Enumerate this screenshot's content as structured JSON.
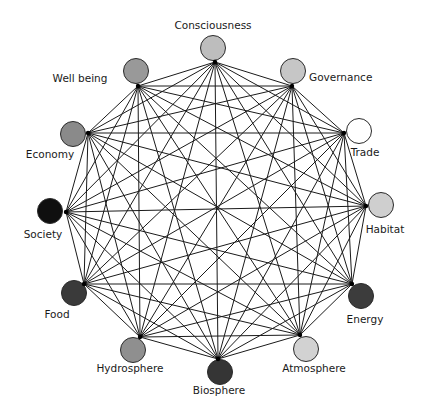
{
  "diagram": {
    "type": "complete-graph",
    "edge_color": "#1a1a1a",
    "nodes": [
      {
        "label": "Consciousness",
        "fill": "#bdbdbd",
        "cx": 213,
        "cy": 48,
        "ax": 215,
        "ay": 62,
        "lx": 213,
        "ly": 25,
        "anchor": "center"
      },
      {
        "label": "Governance",
        "fill": "#c6c6c6",
        "cx": 293,
        "cy": 71,
        "ax": 292,
        "ay": 86,
        "lx": 309,
        "ly": 77,
        "anchor": "left"
      },
      {
        "label": "Trade",
        "fill": "#ffffff",
        "cx": 359,
        "cy": 131,
        "ax": 344,
        "ay": 133,
        "lx": 365,
        "ly": 152,
        "anchor": "center"
      },
      {
        "label": "Habitat",
        "fill": "#cfcfcf",
        "cx": 381,
        "cy": 205,
        "ax": 366,
        "ay": 206,
        "lx": 385,
        "ly": 229,
        "anchor": "center"
      },
      {
        "label": "Energy",
        "fill": "#3c3c3c",
        "cx": 361,
        "cy": 296,
        "ax": 352,
        "ay": 284,
        "lx": 365,
        "ly": 319,
        "anchor": "center"
      },
      {
        "label": "Atmosphere",
        "fill": "#d2d2d2",
        "cx": 306,
        "cy": 349,
        "ax": 300,
        "ay": 335,
        "lx": 314,
        "ly": 368,
        "anchor": "center"
      },
      {
        "label": "Biosphere",
        "fill": "#353535",
        "cx": 220,
        "cy": 372,
        "ax": 218,
        "ay": 359,
        "lx": 219,
        "ly": 390,
        "anchor": "center"
      },
      {
        "label": "Hydrosphere",
        "fill": "#8f8f8f",
        "cx": 133,
        "cy": 350,
        "ax": 140,
        "ay": 337,
        "lx": 130,
        "ly": 368,
        "anchor": "center"
      },
      {
        "label": "Food",
        "fill": "#3a3a3a",
        "cx": 74,
        "cy": 293,
        "ax": 84,
        "ay": 284,
        "lx": 57,
        "ly": 314,
        "anchor": "center"
      },
      {
        "label": "Society",
        "fill": "#0f0f0f",
        "cx": 50,
        "cy": 211,
        "ax": 66,
        "ay": 212,
        "lx": 43,
        "ly": 234,
        "anchor": "center"
      },
      {
        "label": "Economy",
        "fill": "#8a8a8a",
        "cx": 73,
        "cy": 134,
        "ax": 88,
        "ay": 133,
        "lx": 50,
        "ly": 154,
        "anchor": "center"
      },
      {
        "label": "Well being",
        "fill": "#999999",
        "cx": 136,
        "cy": 71,
        "ax": 138,
        "ay": 86,
        "lx": 80,
        "ly": 78,
        "anchor": "center"
      }
    ],
    "node_radius": 12.5
  }
}
